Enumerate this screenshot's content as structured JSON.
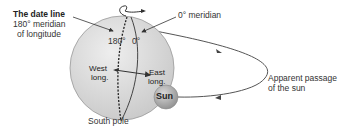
{
  "diagram": {
    "date_line": {
      "title": "The date line",
      "line1": "180° meridian",
      "line2": "of longitude"
    },
    "prime_meridian_label": "0° meridian",
    "globe_labels": {
      "deg180": "180°",
      "deg0": "0°",
      "west1": "West",
      "west2": "long.",
      "east1": "East",
      "east2": "long."
    },
    "south_pole": "South pole",
    "sun": "Sun",
    "sun_path": {
      "line1": "Apparent passage",
      "line2": "of the sun"
    },
    "colors": {
      "globe_fill": "#d9d9d9",
      "sun_fill": "#a8a8a8",
      "line": "#444444"
    }
  }
}
